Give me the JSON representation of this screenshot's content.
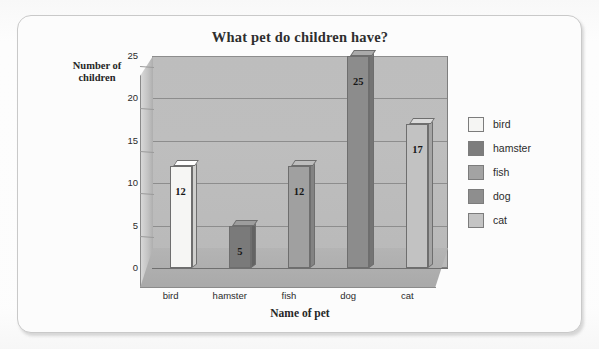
{
  "chart_data": {
    "type": "bar",
    "title": "What pet do children have?",
    "xlabel": "Name of pet",
    "ylabel": "Number of children",
    "categories": [
      "bird",
      "hamster",
      "fish",
      "dog",
      "cat"
    ],
    "values": [
      12,
      5,
      12,
      25,
      17
    ],
    "data_labels": [
      "12",
      "5",
      "12",
      "25",
      "17"
    ],
    "ylim": [
      0,
      25
    ],
    "yticks": [
      "0",
      "5",
      "10",
      "15",
      "20",
      "25"
    ],
    "ytick_values": [
      0,
      5,
      10,
      15,
      20,
      25
    ],
    "grid": true,
    "grid_axis": "y",
    "legend_position": "right",
    "style": "3d-column",
    "legend": [
      {
        "label": "bird",
        "color": "#f5f5f3"
      },
      {
        "label": "hamster",
        "color": "#7d7d7d"
      },
      {
        "label": "fish",
        "color": "#a3a3a3"
      },
      {
        "label": "dog",
        "color": "#8e8e8e"
      },
      {
        "label": "cat",
        "color": "#c4c4c4"
      }
    ],
    "series_colors": {
      "bird": {
        "face": "#f6f6f4",
        "top": "#ffffff",
        "side": "#cfcfcd"
      },
      "hamster": {
        "face": "#7a7a7a",
        "top": "#9d9d9d",
        "side": "#636363"
      },
      "fish": {
        "face": "#a0a0a0",
        "top": "#bdbdbd",
        "side": "#838383"
      },
      "dog": {
        "face": "#8c8c8c",
        "top": "#aaaaaa",
        "side": "#747474"
      },
      "cat": {
        "face": "#c2c2c2",
        "top": "#dadada",
        "side": "#a4a4a4"
      }
    }
  },
  "page": {
    "ghost_text_1": "Maths in",
    "ghost_text_2": "unit"
  }
}
